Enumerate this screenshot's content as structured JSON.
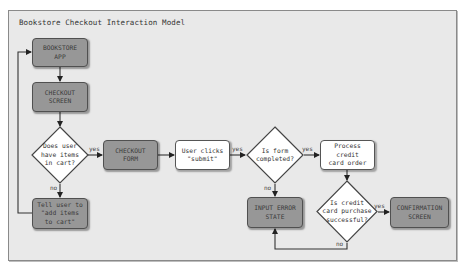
{
  "diagram": {
    "title": "Bookstore Checkout Interaction Model",
    "nodes": {
      "bookstore_app": {
        "label": "BOOKSTORE\nAPP",
        "type": "screen"
      },
      "checkout_screen": {
        "label": "CHECKOUT\nSCREEN",
        "type": "screen"
      },
      "has_items": {
        "label": "Does user\nhave items\nin cart?",
        "type": "decision"
      },
      "tell_user": {
        "label": "Tell user to\n\"add items\nto cart\"",
        "type": "screen"
      },
      "checkout_form": {
        "label": "CHECKOUT\nFORM",
        "type": "screen"
      },
      "user_clicks": {
        "label": "User clicks\n\"submit\"",
        "type": "action"
      },
      "form_completed": {
        "label": "Is form\ncompleted?",
        "type": "decision"
      },
      "process_cc": {
        "label": "Process credit\ncard order",
        "type": "action"
      },
      "input_error": {
        "label": "INPUT ERROR\nSTATE",
        "type": "screen"
      },
      "cc_success": {
        "label": "Is credit\ncard purchase\nsuccessful?",
        "type": "decision"
      },
      "confirmation": {
        "label": "CONFIRMATION\nSCREEN",
        "type": "screen"
      }
    },
    "edge_labels": {
      "has_items_yes": "yes",
      "has_items_no": "no",
      "clicks_yes": "yes",
      "form_yes": "yes",
      "form_no": "no",
      "cc_yes": "yes",
      "cc_no": "no"
    },
    "edges": [
      {
        "from": "bookstore_app",
        "to": "checkout_screen"
      },
      {
        "from": "checkout_screen",
        "to": "has_items"
      },
      {
        "from": "has_items",
        "to": "checkout_form",
        "label": "yes"
      },
      {
        "from": "has_items",
        "to": "tell_user",
        "label": "no"
      },
      {
        "from": "tell_user",
        "to": "bookstore_app"
      },
      {
        "from": "checkout_form",
        "to": "user_clicks"
      },
      {
        "from": "user_clicks",
        "to": "form_completed",
        "label": "yes"
      },
      {
        "from": "form_completed",
        "to": "process_cc",
        "label": "yes"
      },
      {
        "from": "form_completed",
        "to": "input_error",
        "label": "no"
      },
      {
        "from": "process_cc",
        "to": "cc_success"
      },
      {
        "from": "cc_success",
        "to": "confirmation",
        "label": "yes"
      },
      {
        "from": "cc_success",
        "to": "input_error",
        "label": "no"
      }
    ],
    "colors": {
      "canvas": "#e9e9e9",
      "screen_fill": "#979797",
      "action_fill": "#ffffff",
      "line": "#333333"
    }
  }
}
